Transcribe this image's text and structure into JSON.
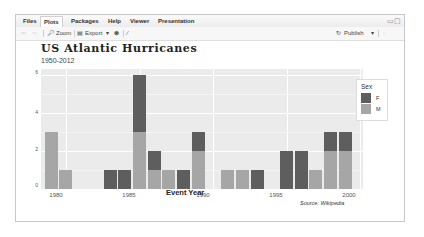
{
  "tabs": [
    {
      "label": "Files",
      "active": false
    },
    {
      "label": "Plots",
      "active": true
    },
    {
      "label": "Packages",
      "active": false
    },
    {
      "label": "Help",
      "active": false
    },
    {
      "label": "Viewer",
      "active": false
    },
    {
      "label": "Presentation",
      "active": false
    }
  ],
  "toolbar": {
    "zoom_label": "Zoom",
    "export_label": "Export",
    "export_caret": "▾",
    "publish_label": "Publish",
    "publish_caret": "▾"
  },
  "window_controls": "▭▢",
  "colors": {
    "F": "#5e5e5e",
    "M": "#a6a6a6",
    "panel_bg": "#ebebeb"
  },
  "chart_data": {
    "type": "bar",
    "stacked": true,
    "title": "US Atlantic Hurricanes",
    "subtitle": "1950-2012",
    "xlabel": "Event Year",
    "ylabel": "Number of Strikes",
    "caption": "Source: Wikipedia",
    "ylim": [
      0,
      6
    ],
    "yticks": [
      "0",
      "2",
      "4",
      "6"
    ],
    "xticks": [
      "1980",
      "1985",
      "1990",
      "1995",
      "2000"
    ],
    "legend": {
      "title": "Sex",
      "entries": [
        "F",
        "M"
      ],
      "position": "right"
    },
    "x": [
      1979,
      1980,
      1983,
      1984,
      1985,
      1986,
      1987,
      1988,
      1989,
      1991,
      1992,
      1993,
      1995,
      1996,
      1997,
      1998,
      1999
    ],
    "series": [
      {
        "name": "F",
        "values": [
          0,
          0,
          1,
          1,
          3,
          1,
          0,
          1,
          1,
          0,
          0,
          1,
          2,
          2,
          0,
          1,
          1
        ]
      },
      {
        "name": "M",
        "values": [
          3,
          1,
          0,
          0,
          3,
          1,
          1,
          0,
          2,
          1,
          1,
          0,
          0,
          0,
          1,
          2,
          2
        ]
      }
    ]
  }
}
